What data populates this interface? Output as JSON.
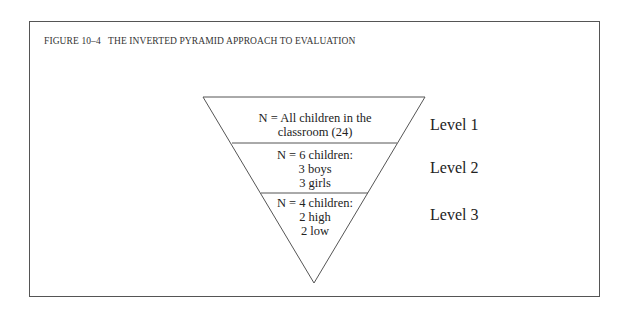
{
  "figure": {
    "caption": "FIGURE 10–4   THE INVERTED PYRAMID APPROACH TO EVALUATION",
    "levels": [
      {
        "label": "Level 1",
        "lines": [
          "N = All children in the",
          "classroom (24)"
        ]
      },
      {
        "label": "Level 2",
        "lines": [
          "N = 6 children:",
          "3 boys",
          "3 girls"
        ]
      },
      {
        "label": "Level 3",
        "lines": [
          "N = 4 children:",
          "2 high",
          "2 low"
        ]
      }
    ]
  },
  "colors": {
    "line": "#555555",
    "text": "#222222",
    "background": "#ffffff"
  }
}
